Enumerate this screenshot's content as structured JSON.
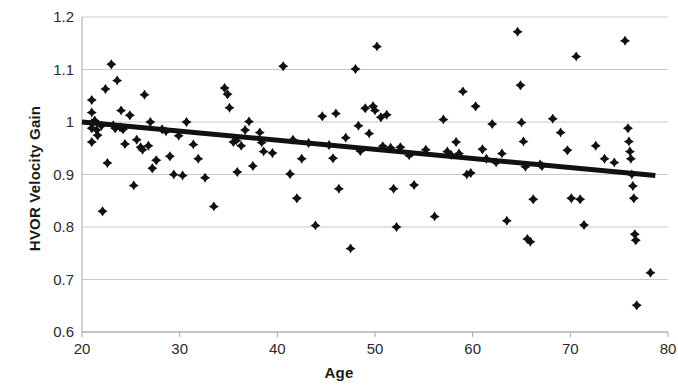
{
  "chart_data": {
    "type": "scatter",
    "title": "",
    "xlabel": "Age",
    "ylabel": "HVOR Velocity Gain",
    "xlim": [
      20,
      80
    ],
    "ylim": [
      0.6,
      1.2
    ],
    "xticks": [
      "20",
      "30",
      "40",
      "50",
      "60",
      "70",
      "80"
    ],
    "yticks": [
      "1.2",
      "1.1",
      "1",
      "0.9",
      "0.8",
      "0.7",
      "0.6"
    ],
    "grid": "horizontal",
    "legend": "none",
    "marker": "diamond",
    "marker_color": "#111111",
    "trendline": {
      "type": "linear",
      "x_start": 20,
      "y_start": 1.0,
      "x_end": 78.7,
      "y_end": 0.898,
      "color": "#111111",
      "width": 5
    },
    "points": [
      [
        21.0,
        1.042
      ],
      [
        21.0,
        1.018
      ],
      [
        21.0,
        0.997
      ],
      [
        21.0,
        0.988
      ],
      [
        21.0,
        0.962
      ],
      [
        21.3,
        1.003
      ],
      [
        21.5,
        0.985
      ],
      [
        21.6,
        0.975
      ],
      [
        22.0,
        0.993
      ],
      [
        22.1,
        0.83
      ],
      [
        22.4,
        1.063
      ],
      [
        22.6,
        0.922
      ],
      [
        23.0,
        1.11
      ],
      [
        23.2,
        0.994
      ],
      [
        23.4,
        0.988
      ],
      [
        23.6,
        1.079
      ],
      [
        23.9,
        0.99
      ],
      [
        24.0,
        1.022
      ],
      [
        24.2,
        0.986
      ],
      [
        24.4,
        0.958
      ],
      [
        24.9,
        1.013
      ],
      [
        25.3,
        0.879
      ],
      [
        25.6,
        0.966
      ],
      [
        26.0,
        0.952
      ],
      [
        26.2,
        0.947
      ],
      [
        26.4,
        1.052
      ],
      [
        26.8,
        0.955
      ],
      [
        27.0,
        1.0
      ],
      [
        27.2,
        0.912
      ],
      [
        27.6,
        0.927
      ],
      [
        28.2,
        0.986
      ],
      [
        28.6,
        0.982
      ],
      [
        29.0,
        0.935
      ],
      [
        29.4,
        0.9
      ],
      [
        29.9,
        0.974
      ],
      [
        30.3,
        0.898
      ],
      [
        30.7,
        1.0
      ],
      [
        31.4,
        0.957
      ],
      [
        31.9,
        0.93
      ],
      [
        32.6,
        0.894
      ],
      [
        33.5,
        0.839
      ],
      [
        34.6,
        1.065
      ],
      [
        34.9,
        1.053
      ],
      [
        35.1,
        1.027
      ],
      [
        35.5,
        0.962
      ],
      [
        35.8,
        0.965
      ],
      [
        35.9,
        0.905
      ],
      [
        36.3,
        0.955
      ],
      [
        36.7,
        0.985
      ],
      [
        37.1,
        1.001
      ],
      [
        37.5,
        0.916
      ],
      [
        38.2,
        0.98
      ],
      [
        38.4,
        0.961
      ],
      [
        38.6,
        0.944
      ],
      [
        39.5,
        0.941
      ],
      [
        40.6,
        1.106
      ],
      [
        41.3,
        0.901
      ],
      [
        41.6,
        0.966
      ],
      [
        42.0,
        0.855
      ],
      [
        42.5,
        0.93
      ],
      [
        43.2,
        0.96
      ],
      [
        43.9,
        0.803
      ],
      [
        44.6,
        1.011
      ],
      [
        45.3,
        0.956
      ],
      [
        45.7,
        0.931
      ],
      [
        46.0,
        1.016
      ],
      [
        46.3,
        0.873
      ],
      [
        47.0,
        0.97
      ],
      [
        47.5,
        0.759
      ],
      [
        48.0,
        1.101
      ],
      [
        48.3,
        0.993
      ],
      [
        48.5,
        0.945
      ],
      [
        49.0,
        1.026
      ],
      [
        49.4,
        0.978
      ],
      [
        49.8,
        1.03
      ],
      [
        50.0,
        1.022
      ],
      [
        50.2,
        1.144
      ],
      [
        50.6,
        1.009
      ],
      [
        50.8,
        0.954
      ],
      [
        51.2,
        1.014
      ],
      [
        51.6,
        0.951
      ],
      [
        51.9,
        0.873
      ],
      [
        52.2,
        0.8
      ],
      [
        52.6,
        0.952
      ],
      [
        53.5,
        0.936
      ],
      [
        54.0,
        0.88
      ],
      [
        55.2,
        0.947
      ],
      [
        56.1,
        0.82
      ],
      [
        57.0,
        1.005
      ],
      [
        57.4,
        0.944
      ],
      [
        57.8,
        0.937
      ],
      [
        58.3,
        0.962
      ],
      [
        58.6,
        0.94
      ],
      [
        59.0,
        1.058
      ],
      [
        59.4,
        0.9
      ],
      [
        59.8,
        0.903
      ],
      [
        60.3,
        1.03
      ],
      [
        61.0,
        0.948
      ],
      [
        61.4,
        0.93
      ],
      [
        62.0,
        0.996
      ],
      [
        62.4,
        0.923
      ],
      [
        63.0,
        0.94
      ],
      [
        63.5,
        0.812
      ],
      [
        64.6,
        1.172
      ],
      [
        64.9,
        1.07
      ],
      [
        65.0,
        0.999
      ],
      [
        65.2,
        0.963
      ],
      [
        65.4,
        0.915
      ],
      [
        65.6,
        0.777
      ],
      [
        65.9,
        0.772
      ],
      [
        66.2,
        0.853
      ],
      [
        66.9,
        0.919
      ],
      [
        67.1,
        0.916
      ],
      [
        68.2,
        1.006
      ],
      [
        69.0,
        0.98
      ],
      [
        69.7,
        0.946
      ],
      [
        70.1,
        0.855
      ],
      [
        70.6,
        1.125
      ],
      [
        71.0,
        0.853
      ],
      [
        71.4,
        0.804
      ],
      [
        72.6,
        0.955
      ],
      [
        73.5,
        0.93
      ],
      [
        74.5,
        0.923
      ],
      [
        75.6,
        1.155
      ],
      [
        75.9,
        0.988
      ],
      [
        76.0,
        0.963
      ],
      [
        76.1,
        0.944
      ],
      [
        76.2,
        0.93
      ],
      [
        76.3,
        0.9
      ],
      [
        76.4,
        0.878
      ],
      [
        76.5,
        0.855
      ],
      [
        76.6,
        0.786
      ],
      [
        76.7,
        0.775
      ],
      [
        76.8,
        0.651
      ],
      [
        78.2,
        0.713
      ]
    ]
  },
  "axis": {
    "y_title": "HVOR Velocity Gain",
    "x_title": "Age",
    "y_labels": [
      "1.2",
      "1.1",
      "1",
      "0.9",
      "0.8",
      "0.7",
      "0.6"
    ],
    "x_labels": [
      "20",
      "30",
      "40",
      "50",
      "60",
      "70",
      "80"
    ]
  },
  "style": {
    "grid_color": "#c9c9c9",
    "axis_color": "#a6a6a6",
    "text_color": "#2b2b2b",
    "marker_color": "#111111",
    "background": "#ffffff"
  }
}
